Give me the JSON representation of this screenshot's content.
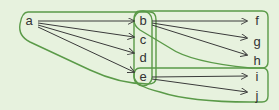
{
  "colors": {
    "background": "#e7f2de",
    "group_outline": "#5a9a48",
    "arrow": "#3a3a3a",
    "label": "#333333"
  },
  "nodes": {
    "a": {
      "label": "a",
      "x": 29,
      "y": 20
    },
    "b": {
      "label": "b",
      "x": 143,
      "y": 20
    },
    "c": {
      "label": "c",
      "x": 143,
      "y": 39
    },
    "d": {
      "label": "d",
      "x": 143,
      "y": 57
    },
    "e": {
      "label": "e",
      "x": 143,
      "y": 76
    },
    "f": {
      "label": "f",
      "x": 257,
      "y": 20
    },
    "g": {
      "label": "g",
      "x": 257,
      "y": 41
    },
    "h": {
      "label": "h",
      "x": 257,
      "y": 60
    },
    "i": {
      "label": "i",
      "x": 257,
      "y": 75
    },
    "j": {
      "label": "j",
      "x": 257,
      "y": 95
    }
  },
  "edges": [
    [
      "a",
      "b"
    ],
    [
      "a",
      "c"
    ],
    [
      "a",
      "d"
    ],
    [
      "a",
      "e"
    ],
    [
      "b",
      "f"
    ],
    [
      "b",
      "g"
    ],
    [
      "b",
      "h"
    ],
    [
      "e",
      "i"
    ],
    [
      "e",
      "j"
    ]
  ],
  "groups": [
    {
      "name": "group-a-to-bcde",
      "members": [
        "a",
        "b",
        "c",
        "d",
        "e"
      ]
    },
    {
      "name": "group-bcde",
      "members": [
        "b",
        "c",
        "d",
        "e"
      ]
    },
    {
      "name": "group-b-to-fgh",
      "members": [
        "b",
        "f",
        "g",
        "h"
      ]
    },
    {
      "name": "group-e-to-ij",
      "members": [
        "e",
        "i",
        "j"
      ]
    }
  ]
}
